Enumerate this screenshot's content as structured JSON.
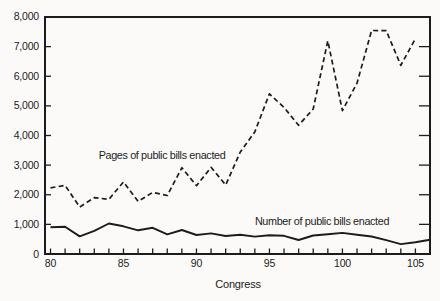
{
  "figure": {
    "background": "#fbfaf8",
    "ink_color": "#1c1c1c"
  },
  "chart_data": {
    "type": "line",
    "title": "",
    "xlabel": "Congress",
    "ylabel": "",
    "xlim": [
      80,
      106
    ],
    "ylim": [
      0,
      8000
    ],
    "grid": false,
    "legend_position": "inline-annotations",
    "y_ticks": [
      0,
      1000,
      2000,
      3000,
      4000,
      5000,
      6000,
      7000,
      8000
    ],
    "y_tick_labels": [
      "0",
      "1,000",
      "2,000",
      "3,000",
      "4,000",
      "5,000",
      "6,000",
      "7,000",
      "8,000"
    ],
    "x_tick_step": 1,
    "x_label_step": 5,
    "x_tick_labels": [
      {
        "congress": 80,
        "label": "80"
      },
      {
        "congress": 85,
        "label": "85"
      },
      {
        "congress": 90,
        "label": "90"
      },
      {
        "congress": 95,
        "label": "95"
      },
      {
        "congress": 100,
        "label": "100"
      },
      {
        "congress": 105,
        "label": "105"
      }
    ],
    "series": [
      {
        "name": "Pages of public bills enacted",
        "style": "dashed",
        "x": [
          80,
          81,
          82,
          83,
          84,
          85,
          86,
          87,
          88,
          89,
          90,
          91,
          92,
          93,
          94,
          95,
          96,
          97,
          98,
          99,
          100,
          101,
          102,
          103,
          104,
          105
        ],
        "values": [
          2236,
          2314,
          1585,
          1899,
          1848,
          2435,
          1774,
          2078,
          1975,
          2912,
          2304,
          2927,
          2330,
          3443,
          4121,
          5403,
          4947,
          4343,
          4893,
          7198,
          4839,
          5767,
          7544,
          7542,
          6369,
          7269
        ]
      },
      {
        "name": "Number of public bills enacted",
        "style": "solid",
        "x": [
          80,
          81,
          82,
          83,
          84,
          85,
          86,
          87,
          88,
          89,
          90,
          91,
          92,
          93,
          94,
          95,
          96,
          97,
          98,
          99,
          100,
          101,
          102,
          103,
          104,
          105,
          106
        ],
        "values": [
          906,
          921,
          594,
          781,
          1028,
          936,
          800,
          885,
          666,
          810,
          640,
          695,
          607,
          649,
          588,
          634,
          613,
          473,
          623,
          664,
          713,
          650,
          590,
          465,
          333,
          394,
          480
        ]
      }
    ]
  }
}
